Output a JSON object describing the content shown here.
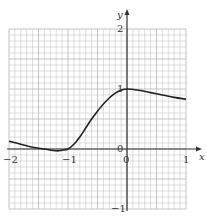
{
  "chart_data": {
    "type": "line",
    "title": "",
    "xlabel": "x",
    "ylabel": "y",
    "xlim": [
      -2,
      1
    ],
    "ylim": [
      -1,
      2
    ],
    "grid": true,
    "grid_minor_step": 0.1,
    "x_ticks": [
      "-2",
      "-1",
      "0",
      "1"
    ],
    "y_ticks": [
      "2",
      "1",
      "0",
      "-1"
    ],
    "series": [
      {
        "name": "curve",
        "x": [
          -2.0,
          -1.8,
          -1.6,
          -1.4,
          -1.2,
          -1.1,
          -1.0,
          -0.9,
          -0.8,
          -0.7,
          -0.6,
          -0.5,
          -0.4,
          -0.3,
          -0.2,
          -0.1,
          0.0,
          0.2,
          0.4,
          0.6,
          0.8,
          1.0
        ],
        "values": [
          0.13,
          0.08,
          0.03,
          0.0,
          -0.03,
          -0.02,
          0.0,
          0.08,
          0.2,
          0.35,
          0.5,
          0.63,
          0.75,
          0.85,
          0.93,
          0.98,
          1.0,
          0.98,
          0.94,
          0.9,
          0.86,
          0.83
        ]
      }
    ],
    "colors": {
      "grid": "#bdbdbd",
      "axis": "#333333",
      "curve": "#222222"
    }
  },
  "labels": {
    "x_axis": "x",
    "y_axis": "y",
    "tick_x_neg2": "−2",
    "tick_x_neg1": "−1",
    "tick_x_0": "0",
    "tick_x_1": "1",
    "tick_y_2": "2",
    "tick_y_1": "1",
    "tick_y_0": "0",
    "tick_y_neg1": "−1"
  }
}
